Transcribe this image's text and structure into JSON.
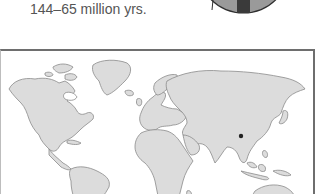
{
  "caption": {
    "text": "144–65 million yrs."
  },
  "era_disc": {
    "fill": "#9a9a9a",
    "stripe": "#3a3a3a",
    "outline": "#2e2e2e"
  },
  "map": {
    "land_color": "#dcdcdc",
    "coast_color": "#8a8a8a",
    "marker": {
      "label": "location-marker",
      "color": "#222222",
      "region": "China"
    }
  }
}
